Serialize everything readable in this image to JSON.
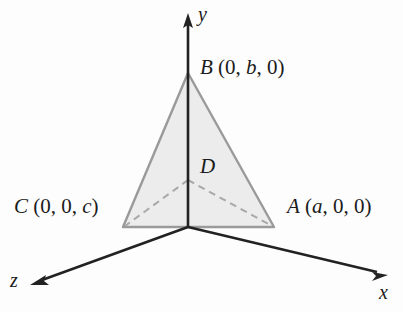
{
  "figure": {
    "type": "3d-coordinate-diagram",
    "background_color": "#fdfdfd",
    "triangle_fill_color": "#ececec",
    "triangle_edge_color": "#999999",
    "dashed_line_color": "#aaaaaa",
    "axis_color": "#222222",
    "text_color": "#1b1b1b"
  },
  "axes": [
    {
      "name": "y-axis",
      "label": "y",
      "direction": "up"
    },
    {
      "name": "x-axis",
      "label": "x",
      "direction": "down-right"
    },
    {
      "name": "z-axis",
      "label": "z",
      "direction": "down-left"
    }
  ],
  "points": {
    "B": {
      "name": "B",
      "label_full": "B (0, b, 0)",
      "letter": "B",
      "coords_open": "(",
      "coord1": "0",
      "coord2": "b",
      "coord3": "0",
      "coords_close": ")",
      "on_axis": "y"
    },
    "C": {
      "name": "C",
      "label_full": "C (0, 0, c)",
      "letter": "C",
      "coords_open": "(",
      "coord1": "0",
      "coord2": "0",
      "coord3": "c",
      "coords_close": ")",
      "on_axis": "z"
    },
    "A": {
      "name": "A",
      "label_full": "A (a, 0, 0)",
      "letter": "A",
      "coords_open": "(",
      "coord1": "a",
      "coord2": "0",
      "coord3": "0",
      "coords_close": ")",
      "on_axis": "x"
    },
    "D": {
      "name": "D",
      "label_full": "D",
      "letter": "D",
      "description": "interior point joined by dashed segments to A, B and C"
    }
  },
  "geometry": {
    "origin": {
      "x": 188,
      "y": 227
    },
    "vertex_B": {
      "x": 188,
      "y": 73
    },
    "vertex_C": {
      "x": 123,
      "y": 227
    },
    "vertex_A": {
      "x": 274,
      "y": 227
    },
    "point_D": {
      "x": 188,
      "y": 180
    },
    "y_axis_tip": {
      "x": 188,
      "y": 16
    },
    "x_axis_tip": {
      "x": 385,
      "y": 277
    },
    "z_axis_tip": {
      "x": 32,
      "y": 286
    }
  }
}
